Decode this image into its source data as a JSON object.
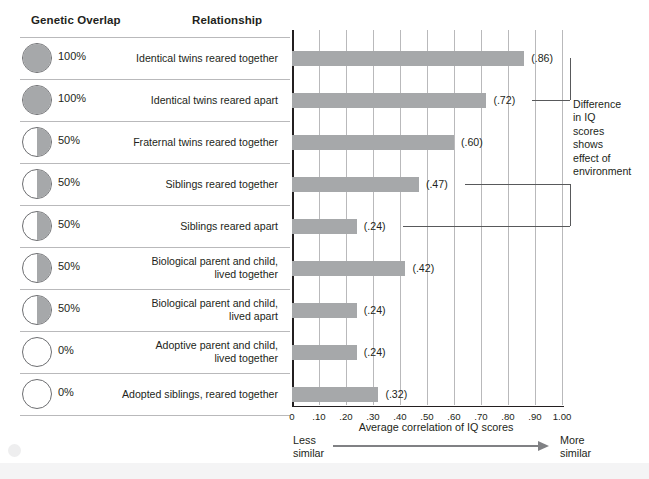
{
  "headers": {
    "genetic_overlap": "Genetic Overlap",
    "relationship": "Relationship"
  },
  "rows": [
    {
      "percent": "100%",
      "fill": "full",
      "relationship": [
        "Identical twins reared together"
      ],
      "value_label": "(.86)",
      "value": 0.86
    },
    {
      "percent": "100%",
      "fill": "full",
      "relationship": [
        "Identical twins reared apart"
      ],
      "value_label": "(.72)",
      "value": 0.72
    },
    {
      "percent": "50%",
      "fill": "half",
      "relationship": [
        "Fraternal twins reared together"
      ],
      "value_label": "(.60)",
      "value": 0.6
    },
    {
      "percent": "50%",
      "fill": "half",
      "relationship": [
        "Siblings reared together"
      ],
      "value_label": "(.47)",
      "value": 0.47
    },
    {
      "percent": "50%",
      "fill": "half",
      "relationship": [
        "Siblings reared apart"
      ],
      "value_label": "(.24)",
      "value": 0.24
    },
    {
      "percent": "50%",
      "fill": "half",
      "relationship": [
        "Biological parent and child,",
        "lived together"
      ],
      "value_label": "(.42)",
      "value": 0.42
    },
    {
      "percent": "50%",
      "fill": "half",
      "relationship": [
        "Biological parent and child,",
        "lived apart"
      ],
      "value_label": "(.24)",
      "value": 0.24
    },
    {
      "percent": "0%",
      "fill": "none",
      "relationship": [
        "Adoptive parent and child,",
        "lived together"
      ],
      "value_label": "(.24)",
      "value": 0.24
    },
    {
      "percent": "0%",
      "fill": "none",
      "relationship": [
        "Adopted siblings, reared together"
      ],
      "value_label": "(.32)",
      "value": 0.32
    }
  ],
  "axis": {
    "tick_labels": [
      "0",
      ".10",
      ".20",
      ".30",
      ".40",
      ".50",
      ".60",
      ".70",
      ".80",
      ".90",
      "1.00"
    ],
    "tick_values": [
      0,
      0.1,
      0.2,
      0.3,
      0.4,
      0.5,
      0.6,
      0.7,
      0.8,
      0.9,
      1.0
    ],
    "title": "Average correlation of IQ scores",
    "left_end": [
      "Less",
      "similar"
    ],
    "right_end": [
      "More",
      "similar"
    ]
  },
  "annotation": {
    "lines": [
      "Difference",
      "in IQ",
      "scores",
      "shows",
      "effect of",
      "environment"
    ],
    "brackets": [
      {
        "top_row": 0,
        "bottom_row": 1
      },
      {
        "top_row": 3,
        "bottom_row": 4
      }
    ]
  },
  "colors": {
    "bar": "#a6a8aa",
    "grid": "#b9b9bb",
    "axis": "#231f20",
    "bracket": "#58595b",
    "arrow": "#808184"
  },
  "chart_data": {
    "type": "bar",
    "orientation": "horizontal",
    "title": "",
    "xlabel": "Average correlation of IQ scores",
    "ylabel": "",
    "xlim": [
      0,
      1.0
    ],
    "grid": true,
    "legend": false,
    "categories": [
      "Identical twins reared together",
      "Identical twins reared apart",
      "Fraternal twins reared together",
      "Siblings reared together",
      "Siblings reared apart",
      "Biological parent and child, lived together",
      "Biological parent and child, lived apart",
      "Adoptive parent and child, lived together",
      "Adopted siblings, reared together"
    ],
    "values": [
      0.86,
      0.72,
      0.6,
      0.47,
      0.24,
      0.42,
      0.24,
      0.24,
      0.32
    ],
    "data_labels": [
      "(.86)",
      "(.72)",
      "(.60)",
      "(.47)",
      "(.24)",
      "(.42)",
      "(.24)",
      "(.24)",
      "(.32)"
    ],
    "genetic_overlap": [
      "100%",
      "100%",
      "50%",
      "50%",
      "50%",
      "50%",
      "50%",
      "0%",
      "0%"
    ],
    "annotations": [
      "Difference in IQ scores shows effect of environment"
    ]
  }
}
